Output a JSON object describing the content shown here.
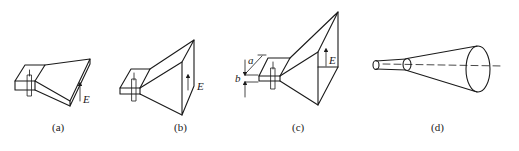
{
  "figure": {
    "panels": [
      {
        "id": "a",
        "caption": "(a)",
        "type": "E-plane sectoral horn",
        "field_label": "E"
      },
      {
        "id": "b",
        "caption": "(b)",
        "type": "H-plane sectoral horn",
        "field_label": "E"
      },
      {
        "id": "c",
        "caption": "(c)",
        "type": "Pyramidal horn",
        "field_label": "E",
        "dimension_labels": [
          "a",
          "b"
        ]
      },
      {
        "id": "d",
        "caption": "(d)",
        "type": "Conical horn"
      }
    ]
  }
}
